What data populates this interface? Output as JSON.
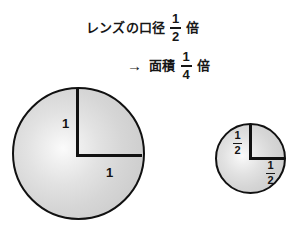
{
  "figure": {
    "caption": {
      "line1": {
        "lead_text": "レンズの口径",
        "fraction": {
          "numerator": "1",
          "denominator": "2"
        },
        "trail_text": "倍"
      },
      "line2": {
        "arrow_icon": "right-arrow-icon",
        "arrow_glyph": "→",
        "lead_text": "面積",
        "fraction": {
          "numerator": "1",
          "denominator": "4"
        },
        "trail_text": "倍"
      }
    },
    "big_circle": {
      "name": "large-lens-circle",
      "radius_label_vertical": "1",
      "radius_label_horizontal": "1"
    },
    "small_circle": {
      "name": "small-lens-circle",
      "radius_label_vertical": {
        "numerator": "1",
        "denominator": "2"
      },
      "radius_label_horizontal": {
        "numerator": "1",
        "denominator": "2"
      }
    },
    "colors": {
      "stroke": "#111111",
      "fill_light": "#fbfbfb",
      "fill_mid": "#d6d6d6",
      "fill_dark": "#c9c9c9",
      "text": "#171717",
      "background": "#ffffff"
    }
  }
}
